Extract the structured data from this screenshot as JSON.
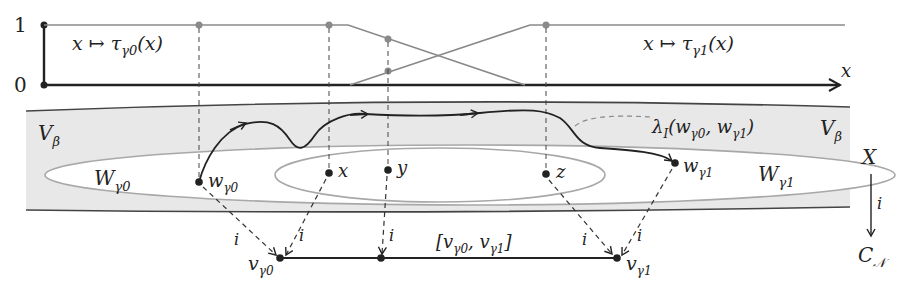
{
  "diagram": {
    "graph": {
      "y_ticks": [
        "1",
        "0"
      ],
      "x_axis_label": "x",
      "tau0_label": {
        "main": "x ↦ τ",
        "sub": "γ0",
        "tail": "(x)"
      },
      "tau1_label": {
        "main": "x ↦ τ",
        "sub": "γ1",
        "tail": "(x)"
      }
    },
    "region": {
      "v_beta_left": {
        "main": "V",
        "sub": "β"
      },
      "v_beta_right": {
        "main": "V",
        "sub": "β"
      },
      "w_gamma0": {
        "main": "W",
        "sub": "γ0"
      },
      "w_gamma1": {
        "main": "W",
        "sub": "γ1"
      },
      "point_w0": {
        "main": "w",
        "sub": "γ0"
      },
      "point_w1": {
        "main": "w",
        "sub": "γ1"
      },
      "point_x": "x",
      "point_y": "y",
      "point_z": "z",
      "lambda_label": {
        "main": "λ",
        "sub": "I",
        "tail": "(w",
        "sub2": "γ0",
        "mid": ", w",
        "sub3": "γ1",
        "end": ")"
      }
    },
    "segment": {
      "v0": {
        "main": "v",
        "sub": "γ0"
      },
      "v1": {
        "main": "v",
        "sub": "γ1"
      },
      "interval": {
        "open": "[v",
        "sub1": "γ0",
        "mid": ", v",
        "sub2": "γ1",
        "close": "]"
      },
      "map_label": "i"
    },
    "side_map": {
      "top": "X",
      "arrow_label": "i",
      "bottom": {
        "main": "C",
        "sub": "𝒩"
      }
    }
  }
}
